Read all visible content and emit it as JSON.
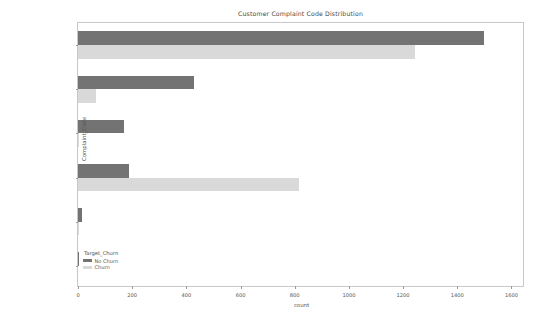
{
  "chart": {
    "title": "Customer Complaint Code Distribution",
    "xlabel": "count",
    "ylabel": "Complaint_Code"
  },
  "legend": {
    "title": "Target_Churn",
    "entries": [
      {
        "label": "No Churn",
        "color": "#737373"
      },
      {
        "label": "Churn",
        "color": "#d9d9d9"
      }
    ]
  },
  "axis": {
    "xticks": [
      "0",
      "200",
      "400",
      "600",
      "800",
      "1000",
      "1200",
      "1400",
      "1600"
    ],
    "yticks": [
      "Billing Problem",
      "Moving",
      "Check Account",
      "Call Quality",
      "Inaccurate Sales Inf",
      "Pricing"
    ]
  },
  "chart_data": {
    "type": "bar",
    "orientation": "horizontal",
    "title": "Customer Complaint Code Distribution",
    "xlabel": "count",
    "ylabel": "Complaint_Code",
    "categories": [
      "Billing Problem",
      "Moving",
      "Check Account",
      "Call Quality",
      "Inaccurate Sales Inf",
      "Pricing"
    ],
    "series": [
      {
        "name": "No Churn",
        "color": "#737373",
        "values": [
          1500,
          430,
          170,
          190,
          15,
          2
        ]
      },
      {
        "name": "Churn",
        "color": "#d9d9d9",
        "values": [
          1245,
          67,
          5,
          815,
          1,
          0
        ]
      }
    ],
    "xlim": [
      0,
      1650
    ],
    "xticks": [
      0,
      200,
      400,
      600,
      800,
      1000,
      1200,
      1400,
      1600
    ],
    "grid": false,
    "legend_title": "Target_Churn",
    "legend_position": "lower left"
  }
}
